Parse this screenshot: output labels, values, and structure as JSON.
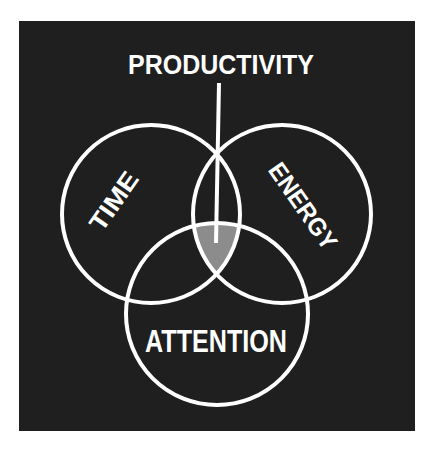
{
  "diagram": {
    "type": "venn",
    "title": "PRODUCTIVITY",
    "background_color": "#1f1f1f",
    "outer_background_color": "#ffffff",
    "stroke_color": "#ffffff",
    "intersection_fill": "#8c8c8c",
    "sets": [
      {
        "id": "time",
        "label": "TIME"
      },
      {
        "id": "energy",
        "label": "ENERGY"
      },
      {
        "id": "attention",
        "label": "ATTENTION"
      }
    ],
    "highlighted_region": {
      "sets": [
        "time",
        "energy",
        "attention"
      ],
      "annotation": "PRODUCTIVITY"
    }
  }
}
